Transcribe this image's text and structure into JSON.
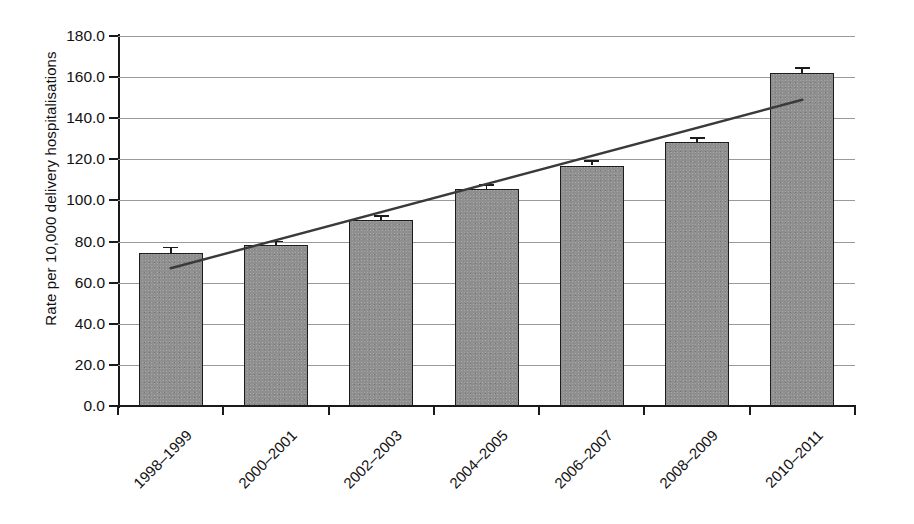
{
  "chart_data": {
    "type": "bar",
    "title": "",
    "xlabel": "",
    "ylabel": "Rate per 10,000 delivery hospitalisations",
    "categories": [
      "1998–1999",
      "2000–2001",
      "2002–2003",
      "2004–2005",
      "2006–2007",
      "2008–2009",
      "2010–2011"
    ],
    "values": [
      74.5,
      78.5,
      90.5,
      105.5,
      117.0,
      128.5,
      162.0
    ],
    "error_upper": [
      3.0,
      2.0,
      2.5,
      2.5,
      2.5,
      2.5,
      3.0
    ],
    "error_lower": [
      0.0,
      0.0,
      0.0,
      0.0,
      0.0,
      0.0,
      0.0
    ],
    "ylim": [
      0.0,
      180.0
    ],
    "ytick_step": 20.0,
    "ytick_labels": [
      "0.0",
      "20.0",
      "40.0",
      "60.0",
      "80.0",
      "100.0",
      "120.0",
      "140.0",
      "160.0",
      "180.0"
    ],
    "ytick_values": [
      0,
      20,
      40,
      60,
      80,
      100,
      120,
      140,
      160,
      180
    ],
    "grid": true,
    "grid_axis": "y",
    "legend": false,
    "legend_position": "none",
    "series": [
      {
        "name": "Rate per 10,000 delivery hospitalisations",
        "values": [
          74.5,
          78.5,
          90.5,
          105.5,
          117.0,
          128.5,
          162.0
        ],
        "color": "#8f8f8f",
        "edge_color": "#1c1c1c"
      },
      {
        "name": "Linear trend line",
        "type": "line",
        "color": "#3a3a3a",
        "x_start_category": "1998–1999",
        "x_end_category": "2010–2011",
        "y_start": 67.0,
        "y_end": 149.0
      }
    ],
    "annotations": []
  },
  "colors": {
    "bar_fill": "#8f8f8f",
    "bar_edge": "#1c1c1c",
    "trend_line": "#3a3a3a",
    "gridline": "#9a9a9a",
    "axis": "#1a1a1a",
    "text": "#111111",
    "background": "#ffffff"
  }
}
